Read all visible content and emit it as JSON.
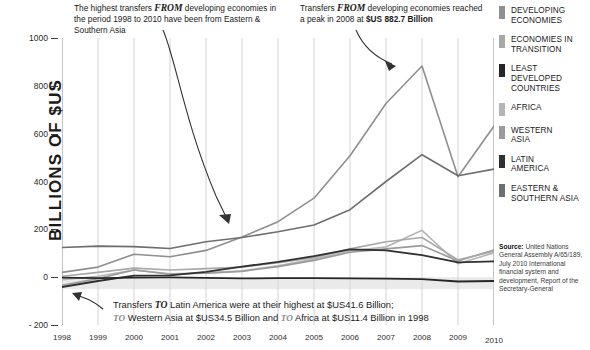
{
  "axis": {
    "y_title": "BILLIONS OF $US",
    "y_ticks": [
      "1000",
      "800",
      "600",
      "400",
      "200",
      "0",
      "- 200"
    ],
    "x_ticks": [
      "1998",
      "1999",
      "2000",
      "2001",
      "2002",
      "2003",
      "2004",
      "2005",
      "2006",
      "2007",
      "2008",
      "2009",
      "2010"
    ]
  },
  "annotations": {
    "top_left": {
      "part1": "The highest transfers ",
      "em": "FROM",
      "part2": " developing economies in the period 1998 to 2010 have been from Eastern & Southern Asia"
    },
    "top_right": {
      "part1": "Transfers ",
      "em": "FROM",
      "part2": " developing economies reached a peak in 2008 at ",
      "bold": "$US 882.7 Billion"
    },
    "bottom": {
      "line1_a": "Transfers ",
      "line1_em": "TO",
      "line1_b": " Latin America were at their highest at $US41.6 Billion;",
      "line2_em1": "TO",
      "line2_a": " Western Asia at $US34.5 Billion and ",
      "line2_em2": "TO",
      "line2_b": " Africa at $US11.4 Billion in 1998"
    }
  },
  "legend": {
    "items": [
      {
        "label_line1": "DEVELOPING",
        "label_line2": "ECONOMIES",
        "color": "#8f8f8f"
      },
      {
        "label_line1": "ECONOMIES IN",
        "label_line2": "TRANSITION",
        "color": "#a8a8a8"
      },
      {
        "label_line1": "LEAST DEVELOPED",
        "label_line2": "COUNTRIES",
        "color": "#262626"
      },
      {
        "label_line1": "AFRICA",
        "label_line2": "",
        "color": "#b5b5b5"
      },
      {
        "label_line1": "WESTERN",
        "label_line2": "ASIA",
        "color": "#9b9b9b"
      },
      {
        "label_line1": "LATIN",
        "label_line2": "AMERICA",
        "color": "#303030"
      },
      {
        "label_line1": "EASTERN &",
        "label_line2": "SOUTHERN ASIA",
        "color": "#6e6e6e"
      }
    ]
  },
  "source": {
    "label": "Source:",
    "text": " United Nations General Assembly A/65/189, July 2010 International financial system and development, Report of the Secretary-General"
  },
  "chart_data": {
    "type": "line",
    "title": "",
    "xlabel": "",
    "ylabel": "BILLIONS OF $US",
    "x": [
      1998,
      1999,
      2000,
      2001,
      2002,
      2003,
      2004,
      2005,
      2006,
      2007,
      2008,
      2009,
      2010
    ],
    "ylim": [
      -200,
      1000
    ],
    "xlim": [
      1998,
      2010
    ],
    "grid": "vertical",
    "legend_position": "right",
    "series": [
      {
        "name": "DEVELOPING ECONOMIES",
        "color": "#8f8f8f",
        "values": [
          20,
          42,
          96,
          85,
          112,
          168,
          232,
          330,
          508,
          726,
          883,
          420,
          632
        ]
      },
      {
        "name": "ECONOMIES IN TRANSITION",
        "color": "#a8a8a8",
        "values": [
          4,
          20,
          38,
          30,
          36,
          42,
          60,
          82,
          118,
          148,
          166,
          72,
          108
        ]
      },
      {
        "name": "LEAST DEVELOPED COUNTRIES",
        "color": "#262626",
        "values": [
          -2,
          -4,
          -2,
          -1,
          -3,
          -5,
          -4,
          -4,
          -5,
          -6,
          -8,
          -18,
          -16
        ]
      },
      {
        "name": "AFRICA",
        "color": "#b5b5b5",
        "values": [
          -11,
          4,
          30,
          14,
          18,
          26,
          48,
          76,
          110,
          126,
          196,
          56,
          102
        ]
      },
      {
        "name": "WESTERN ASIA",
        "color": "#9b9b9b",
        "values": [
          -34,
          -6,
          30,
          12,
          16,
          24,
          44,
          70,
          104,
          118,
          132,
          68,
          114
        ]
      },
      {
        "name": "LATIN AMERICA",
        "color": "#303030",
        "values": [
          -41,
          -16,
          6,
          8,
          22,
          44,
          64,
          88,
          116,
          112,
          92,
          62,
          66
        ]
      },
      {
        "name": "EASTERN & SOUTHERN ASIA",
        "color": "#6e6e6e",
        "values": [
          124,
          130,
          128,
          120,
          148,
          166,
          190,
          218,
          282,
          400,
          512,
          424,
          452
        ]
      }
    ]
  }
}
